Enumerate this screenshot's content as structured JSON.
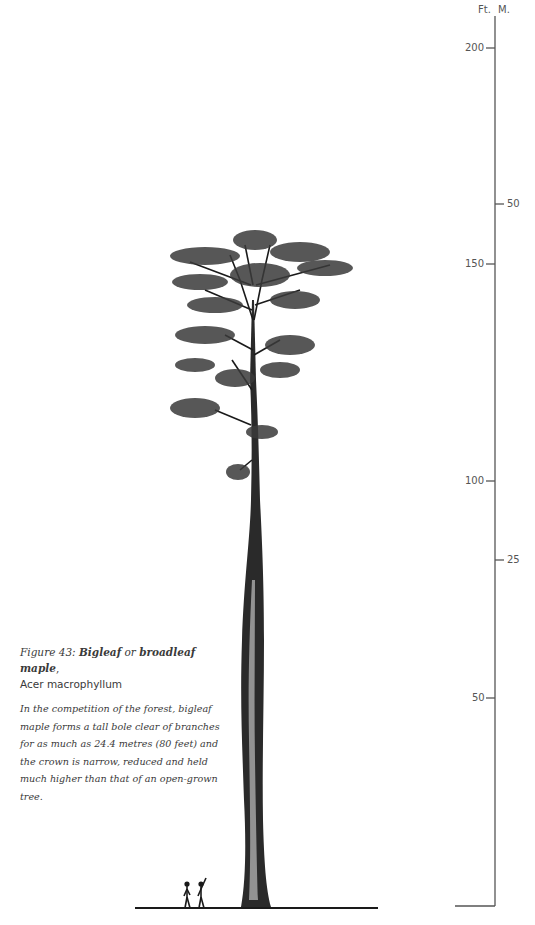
{
  "figure": {
    "number_label": "Figure 43:",
    "common_name_1": "Bigleaf",
    "connector": "or",
    "common_name_2": "broadleaf maple",
    "comma": ",",
    "scientific_name": "Acer macrophyllum",
    "description": "In the competition of the forest, bigleaf maple forms a tall bole clear of branches for as much as 24.4 metres (80 feet) and the crown is narrow, reduced and held much higher than that of an open-grown tree."
  },
  "scale": {
    "feet_header": "Ft.",
    "metres_header": "M.",
    "feet_ticks": [
      {
        "label": "200",
        "value": 200,
        "y": 48
      },
      {
        "label": "150",
        "value": 150,
        "y": 264
      },
      {
        "label": "100",
        "value": 100,
        "y": 481
      },
      {
        "label": "50",
        "value": 50,
        "y": 698
      }
    ],
    "metre_ticks": [
      {
        "label": "50",
        "value": 50,
        "y": 204
      },
      {
        "label": "25",
        "value": 25,
        "y": 560
      }
    ],
    "ground_y": 906,
    "axis_x": 495
  },
  "illustration": {
    "subject": "bigleaf maple tree, forest-grown form",
    "scale_figures": 2
  },
  "colors": {
    "ink": "#1a1a1a",
    "axis": "#555555",
    "text": "#3a3a3a"
  }
}
